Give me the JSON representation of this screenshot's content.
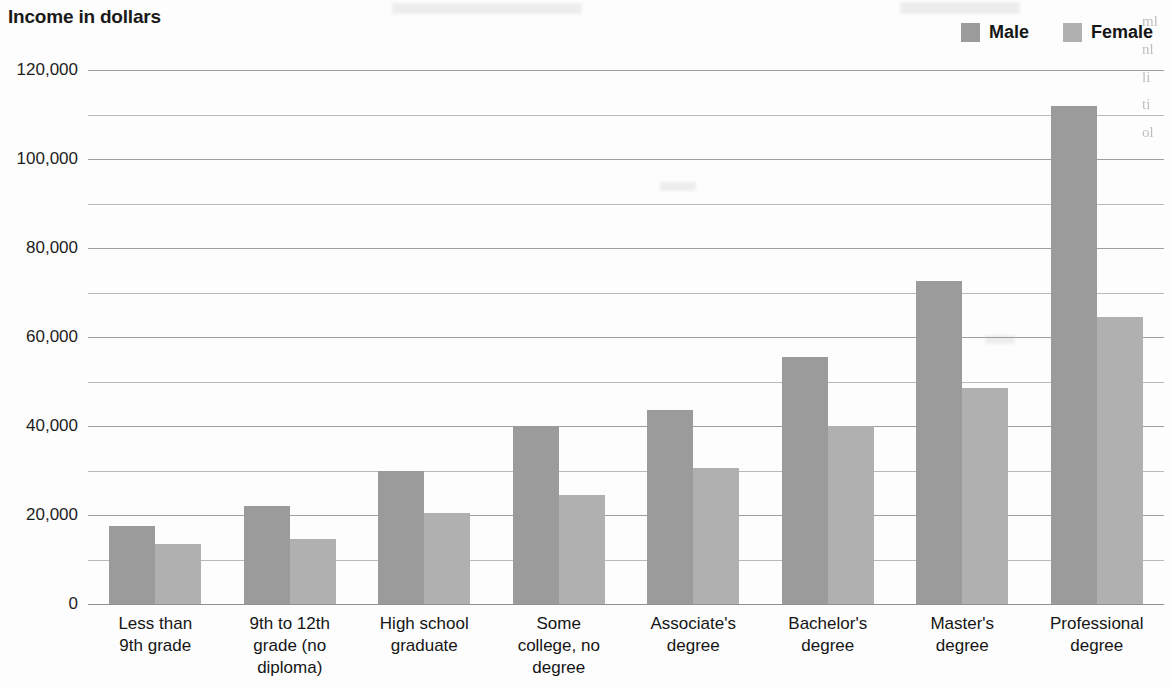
{
  "chart_data": {
    "type": "bar",
    "title": "Income in dollars",
    "xlabel": "",
    "ylabel": "Income in dollars",
    "categories": [
      "Less than 9th grade",
      "9th to 12th grade (no diploma)",
      "High school graduate",
      "Some college, no degree",
      "Associate's degree",
      "Bachelor's degree",
      "Master's degree",
      "Professional degree"
    ],
    "category_lines": [
      [
        "Less than",
        "9th grade"
      ],
      [
        "9th to 12th",
        "grade (no",
        "diploma)"
      ],
      [
        "High school",
        "graduate"
      ],
      [
        "Some",
        "college, no",
        "degree"
      ],
      [
        "Associate's",
        "degree"
      ],
      [
        "Bachelor's",
        "degree"
      ],
      [
        "Master's",
        "degree"
      ],
      [
        "Professional",
        "degree"
      ]
    ],
    "series": [
      {
        "name": "Male",
        "color": "#9b9b9b",
        "values": [
          17500,
          22000,
          30000,
          40000,
          43500,
          55500,
          72500,
          112000
        ]
      },
      {
        "name": "Female",
        "color": "#b0b0b0",
        "values": [
          13500,
          14500,
          20500,
          24500,
          30500,
          40000,
          48500,
          64500
        ]
      }
    ],
    "ylim": [
      0,
      120000
    ],
    "ytick_values": [
      0,
      20000,
      40000,
      60000,
      80000,
      100000,
      120000
    ],
    "ytick_labels": [
      "0",
      "20,000",
      "40,000",
      "60,000",
      "80,000",
      "100,000",
      "120,000"
    ],
    "minor_gridline_values": [
      10000,
      30000,
      50000,
      70000,
      90000,
      110000
    ],
    "grid": true,
    "legend_position": "top-right"
  },
  "legend": {
    "entries": [
      {
        "label": "Male",
        "color": "#9b9b9b"
      },
      {
        "label": "Female",
        "color": "#b0b0b0"
      }
    ]
  },
  "margin_text": {
    "fragment": "ml\nnl\nli\nti\nol"
  }
}
